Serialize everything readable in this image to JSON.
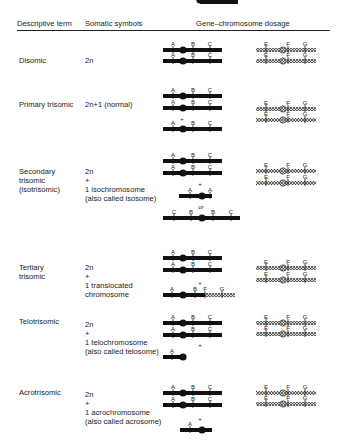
{
  "headers": {
    "term": "Descriptive term",
    "symbols": "Somatic symbols",
    "dosage": "Gene–chromosome dosage"
  },
  "rows": [
    {
      "term": "Disomic",
      "symbols": "2n",
      "abc_chromosomes": [
        {
          "type": "normal",
          "genes": [
            "A",
            "B",
            "C"
          ]
        },
        {
          "type": "normal",
          "genes": [
            "A",
            "B",
            "C"
          ]
        }
      ],
      "efg_chromosomes": [
        {
          "genes": [
            "E",
            "F",
            "G"
          ]
        },
        {
          "genes": [
            "E",
            "F",
            "G"
          ]
        }
      ]
    },
    {
      "term": "Primary trisomic",
      "symbols": "2n+1 (normal)",
      "abc_chromosomes": [
        {
          "type": "normal",
          "genes": [
            "A",
            "B",
            "C"
          ]
        },
        {
          "type": "normal",
          "genes": [
            "A",
            "B",
            "C"
          ]
        },
        {
          "type": "normal",
          "genes": [
            "A",
            "B",
            "C"
          ],
          "prefix": "+"
        }
      ],
      "efg_chromosomes": [
        {
          "genes": [
            "E",
            "F",
            "G"
          ]
        },
        {
          "genes": [
            "E",
            "F",
            "G"
          ]
        }
      ]
    },
    {
      "term": "Secondary\ntrisomic\n(isotrisomic)",
      "symbols": "2n\n+\n1 isochromosome\n(also called isosome)",
      "abc_chromosomes": [
        {
          "type": "normal",
          "genes": [
            "A",
            "B",
            "C"
          ]
        },
        {
          "type": "normal",
          "genes": [
            "A",
            "B",
            "C"
          ]
        },
        {
          "type": "isochromosome-short",
          "genes": [
            "A",
            "A"
          ],
          "prefix": "+"
        },
        {
          "type": "isochromosome-long",
          "genes": [
            "C",
            "B",
            "B",
            "C"
          ],
          "prefix": "or"
        }
      ],
      "efg_chromosomes": [
        {
          "genes": [
            "E",
            "F",
            "G"
          ]
        },
        {
          "genes": [
            "E",
            "F",
            "G"
          ]
        }
      ]
    },
    {
      "term": "Tertiary\ntrisomic",
      "symbols": "2n\n+\n1 translocated\nchromosome",
      "abc_chromosomes": [
        {
          "type": "normal",
          "genes": [
            "A",
            "B",
            "C"
          ]
        },
        {
          "type": "normal",
          "genes": [
            "A",
            "B",
            "C"
          ]
        },
        {
          "type": "translocated",
          "genes": [
            "A",
            "B",
            "F",
            "G"
          ],
          "prefix": "+"
        }
      ],
      "efg_chromosomes": [
        {
          "genes": [
            "E",
            "F",
            "G"
          ]
        },
        {
          "genes": [
            "E",
            "F",
            "G"
          ]
        }
      ]
    },
    {
      "term": "Telotrisomic",
      "symbols": "2n\n+\n1 telochromosome\n(also called telosome)",
      "abc_chromosomes": [
        {
          "type": "normal",
          "genes": [
            "A",
            "B",
            "C"
          ]
        },
        {
          "type": "normal",
          "genes": [
            "A",
            "B",
            "C"
          ]
        },
        {
          "type": "telo-short",
          "genes": [
            "A"
          ],
          "prefix": "+"
        },
        {
          "type": "telo-long",
          "genes": [
            "B",
            "C"
          ],
          "prefix": "or"
        }
      ],
      "efg_chromosomes": [
        {
          "genes": [
            "E",
            "F",
            "G"
          ]
        },
        {
          "genes": [
            "E",
            "F",
            "G"
          ]
        }
      ]
    },
    {
      "term": "Acrotrisomic",
      "symbols": "2n\n+\n1 acrochromosome\n(also called acrosome)",
      "abc_chromosomes": [
        {
          "type": "normal",
          "genes": [
            "A",
            "B",
            "C"
          ]
        },
        {
          "type": "normal",
          "genes": [
            "A",
            "B",
            "C"
          ]
        },
        {
          "type": "acro",
          "genes": [
            "A"
          ],
          "prefix": "+"
        }
      ],
      "efg_chromosomes": [
        {
          "genes": [
            "E",
            "F",
            "G"
          ]
        },
        {
          "genes": [
            "E",
            "F",
            "G"
          ]
        }
      ]
    }
  ],
  "connectors": {
    "plus": "+",
    "or": "or"
  }
}
